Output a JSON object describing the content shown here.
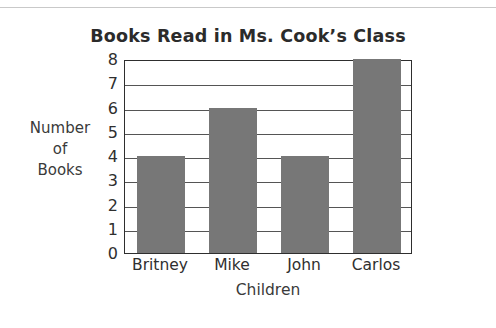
{
  "chart_data": {
    "type": "bar",
    "title": "Books Read in Ms. Cook’s Class",
    "xlabel": "Children",
    "ylabel": "Number of Books",
    "ylabel_lines": [
      "Number",
      "of",
      "Books"
    ],
    "categories": [
      "Britney",
      "Mike",
      "John",
      "Carlos"
    ],
    "values": [
      4,
      6,
      4,
      8
    ],
    "ylim": [
      0,
      8
    ],
    "ytick_labels": [
      "0",
      "1",
      "2",
      "3",
      "4",
      "5",
      "6",
      "7",
      "8"
    ],
    "ytick_values": [
      0,
      1,
      2,
      3,
      4,
      5,
      6,
      7,
      8
    ],
    "grid": true,
    "grid_axis": "y",
    "legend": false,
    "bar_color": "#777777",
    "frame_color": "#2e2e2e",
    "gridline_color": "#555555",
    "title_color": "#2b2b2b",
    "label_color": "#2f2f2f"
  }
}
